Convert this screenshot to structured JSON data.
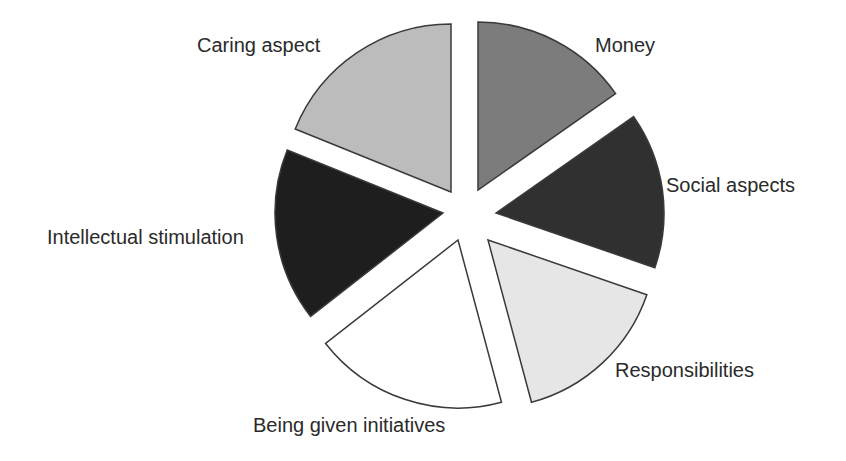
{
  "chart_data": {
    "type": "pie",
    "title": "",
    "exploded": true,
    "legend": "none (direct labels)",
    "categories": [
      "Money",
      "Social aspects",
      "Responsibilities",
      "Being given initiatives",
      "Intellectual stimulation",
      "Caring aspect"
    ],
    "values": [
      15.3,
      15.0,
      15.6,
      18.6,
      16.7,
      18.9
    ],
    "value_unit": "approx. percent (estimated from slice angles; no values shown)"
  },
  "pie": {
    "radius": 168,
    "stroke": "#3a3a3a",
    "slices": [
      {
        "label": "Money",
        "start": -90,
        "end": -35,
        "apex_x": 478,
        "apex_y": 190,
        "color": "#7c7c7c",
        "label_x": 595,
        "label_y": 52
      },
      {
        "label": "Social aspects",
        "start": -35,
        "end": 19,
        "apex_x": 496,
        "apex_y": 213,
        "color": "#303030",
        "label_x": 666,
        "label_y": 192
      },
      {
        "label": "Responsibilities",
        "start": 19,
        "end": 75,
        "apex_x": 488,
        "apex_y": 240,
        "color": "#e6e6e6",
        "label_x": 615,
        "label_y": 377
      },
      {
        "label": "Being given initiatives",
        "start": 75,
        "end": 142,
        "apex_x": 458,
        "apex_y": 240,
        "color": "#ffffff",
        "label_x": 253,
        "label_y": 432
      },
      {
        "label": "Intellectual stimulation",
        "start": 142,
        "end": 202,
        "apex_x": 443,
        "apex_y": 213,
        "color": "#1e1e1e",
        "label_x": 47,
        "label_y": 244
      },
      {
        "label": "Caring aspect",
        "start": 202,
        "end": 270,
        "apex_x": 451,
        "apex_y": 192,
        "color": "#bcbcbc",
        "label_x": 197,
        "label_y": 52
      }
    ]
  },
  "labels": {
    "money": "Money",
    "social": "Social aspects",
    "responsibilities": "Responsibilities",
    "being_given": "Being given initiatives",
    "intellectual": "Intellectual stimulation",
    "caring": "Caring aspect"
  }
}
